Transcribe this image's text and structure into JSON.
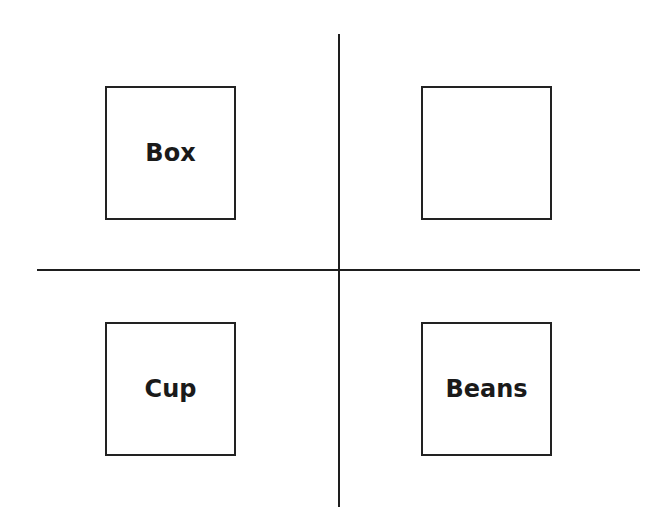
{
  "diagram": {
    "type": "four-quadrant",
    "colors": {
      "background": "#ffffff",
      "line": "#1e1e1e",
      "box_border": "#222222",
      "text": "#1a1a1a"
    },
    "quadrants": {
      "top_left": {
        "label": "Box"
      },
      "top_right": {
        "label": ""
      },
      "bottom_left": {
        "label": "Cup"
      },
      "bottom_right": {
        "label": "Beans"
      }
    }
  }
}
